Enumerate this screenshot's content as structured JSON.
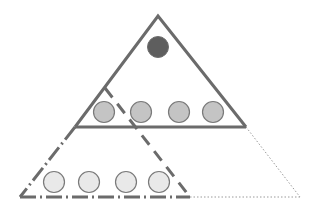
{
  "diagram": {
    "colors": {
      "line": "#6b6b6b",
      "dotted": "#9a9a9a",
      "top_circle_fill": "#5e5e5e",
      "middle_circle_fill": "#c4c4c4",
      "bottom_circle_fill": "#e9e9e9",
      "circle_stroke": "#7a7a7a"
    },
    "top_triangle": {
      "apex": [
        158,
        16
      ],
      "left": [
        75,
        127
      ],
      "right": [
        246,
        127
      ],
      "style": "solid"
    },
    "dashed_triangle": {
      "apex": [
        105,
        88
      ],
      "left": [
        20,
        197
      ],
      "right": [
        190,
        197
      ],
      "style": "dashed"
    },
    "dotted_extension": {
      "from": [
        246,
        127
      ],
      "to": [
        300,
        197
      ],
      "base_from": [
        190,
        197
      ],
      "base_to": [
        300,
        197
      ],
      "style": "dotted"
    },
    "rows": [
      {
        "name": "top",
        "count": 1,
        "circles": [
          [
            158,
            47
          ]
        ],
        "radius": 10
      },
      {
        "name": "middle",
        "count": 4,
        "circles": [
          [
            104,
            112
          ],
          [
            141,
            112
          ],
          [
            179,
            112
          ],
          [
            213,
            112
          ]
        ],
        "radius": 10.5
      },
      {
        "name": "bottom",
        "count": 4,
        "circles": [
          [
            54,
            182
          ],
          [
            89,
            182
          ],
          [
            126,
            182
          ],
          [
            159,
            182
          ]
        ],
        "radius": 10.5
      }
    ]
  }
}
